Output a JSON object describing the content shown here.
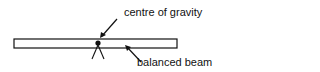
{
  "diagram": {
    "labels": {
      "centre_of_gravity": "centre of gravity",
      "balanced_beam": "balanced beam"
    },
    "colors": {
      "stroke": "#111111",
      "background": "#ffffff"
    }
  }
}
